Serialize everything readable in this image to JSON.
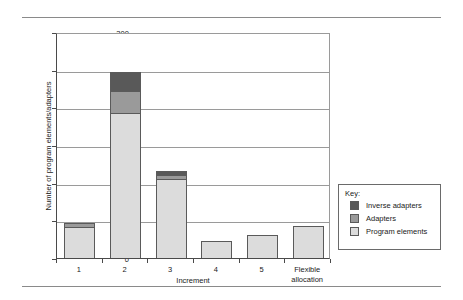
{
  "chart_data": {
    "type": "bar",
    "subtype": "stacked-bar",
    "title": "",
    "xlabel": "Increment",
    "ylabel": "Number of program elements/adapters",
    "categories": [
      "1",
      "2",
      "3",
      "4",
      "5",
      "Flexible allocation"
    ],
    "category_lines": [
      [
        "1"
      ],
      [
        "2"
      ],
      [
        "3"
      ],
      [
        "4"
      ],
      [
        "5"
      ],
      [
        "Flexible",
        "allocation"
      ]
    ],
    "series": [
      {
        "name": "Program elements",
        "color": "#dcdcdc",
        "values": [
          41,
          193,
          105,
          23,
          30,
          42
        ]
      },
      {
        "name": "Adapters",
        "color": "#9a9a9a",
        "values": [
          6,
          29,
          5,
          0,
          0,
          0
        ]
      },
      {
        "name": "Inverse adapters",
        "color": "#595959",
        "values": [
          0,
          25,
          5,
          0,
          0,
          0
        ]
      }
    ],
    "totals": [
      47,
      247,
      115,
      23,
      30,
      42
    ],
    "ylim": [
      0,
      300
    ],
    "yticks": [
      0,
      50,
      100,
      150,
      200,
      250,
      300
    ],
    "ytick_labels": [
      "0",
      "50",
      "100",
      "150",
      "200",
      "250",
      "300"
    ],
    "grid": true,
    "grid_axis": "y",
    "legend_position": "right-outside",
    "legend_title": "Key:",
    "legend_order": [
      "Inverse adapters",
      "Adapters",
      "Program elements"
    ]
  },
  "legend": {
    "title": "Key:",
    "entries": [
      {
        "label": "Inverse adapters",
        "swatch": "s2"
      },
      {
        "label": "Adapters",
        "swatch": "s1"
      },
      {
        "label": "Program elements",
        "swatch": "s0"
      }
    ]
  }
}
